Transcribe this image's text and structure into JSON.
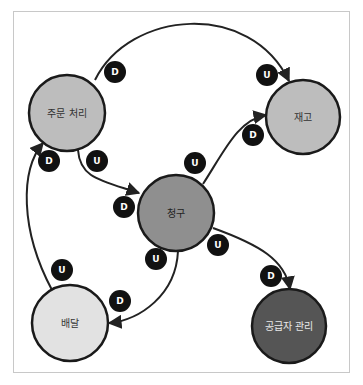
{
  "diagram": {
    "type": "context-map",
    "nodes": [
      {
        "id": "order",
        "label": "주문 처리",
        "cx": 67,
        "cy": 113,
        "r": 38,
        "fill": "#bdbdbd",
        "text_color": "#333333"
      },
      {
        "id": "inventory",
        "label": "재고",
        "cx": 303,
        "cy": 117,
        "r": 37,
        "fill": "#bdbdbd",
        "text_color": "#333333"
      },
      {
        "id": "billing",
        "label": "청구",
        "cx": 176,
        "cy": 213,
        "r": 38,
        "fill": "#8f8f8f",
        "text_color": "#222222"
      },
      {
        "id": "delivery",
        "label": "배달",
        "cx": 70,
        "cy": 323,
        "r": 38,
        "fill": "#e2e2e2",
        "text_color": "#333333"
      },
      {
        "id": "supplier",
        "label": "공급자 관리",
        "cx": 289,
        "cy": 326,
        "r": 37,
        "fill": "#555555",
        "text_color": "#e8e8e8"
      }
    ],
    "edges": [
      {
        "from": "order",
        "to": "inventory",
        "upstream_badge": "D",
        "downstream_badge": "U"
      },
      {
        "from": "order",
        "to": "billing",
        "upstream_badge": "U",
        "downstream_badge": "D"
      },
      {
        "from": "billing",
        "to": "inventory",
        "upstream_badge": "U",
        "downstream_badge": "D"
      },
      {
        "from": "billing",
        "to": "delivery",
        "upstream_badge": "U",
        "downstream_badge": "D"
      },
      {
        "from": "billing",
        "to": "supplier",
        "upstream_badge": "U",
        "downstream_badge": "D"
      },
      {
        "from": "delivery",
        "to": "order",
        "upstream_badge": "U",
        "downstream_badge": "D"
      }
    ],
    "badges": [
      {
        "label": "D",
        "cx": 115,
        "cy": 72
      },
      {
        "label": "U",
        "cx": 267,
        "cy": 75
      },
      {
        "label": "D",
        "cx": 49,
        "cy": 161
      },
      {
        "label": "U",
        "cx": 97,
        "cy": 161
      },
      {
        "label": "U",
        "cx": 195,
        "cy": 163
      },
      {
        "label": "D",
        "cx": 253,
        "cy": 135
      },
      {
        "label": "D",
        "cx": 124,
        "cy": 207
      },
      {
        "label": "U",
        "cx": 156,
        "cy": 259
      },
      {
        "label": "U",
        "cx": 218,
        "cy": 245
      },
      {
        "label": "D",
        "cx": 120,
        "cy": 301
      },
      {
        "label": "U",
        "cx": 62,
        "cy": 270
      },
      {
        "label": "D",
        "cx": 271,
        "cy": 276
      }
    ],
    "badge_fill": "#111111",
    "edge_color": "#222222"
  }
}
